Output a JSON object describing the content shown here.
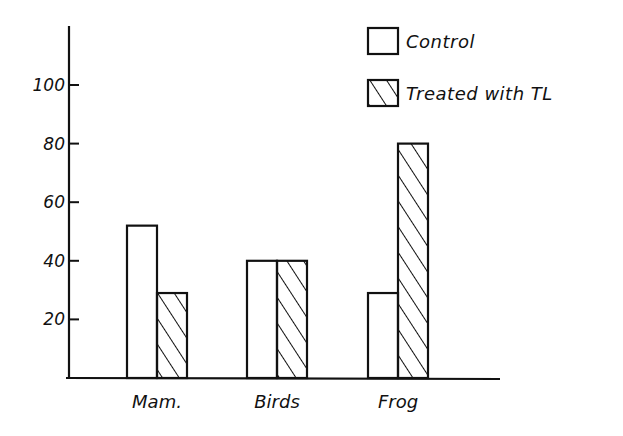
{
  "chart_data": {
    "type": "bar",
    "title": "",
    "xlabel": "",
    "ylabel": "",
    "categories": [
      "Mam.",
      "Birds",
      "Frog"
    ],
    "series": [
      {
        "name": "Control",
        "pattern": "none",
        "values": [
          52,
          40,
          29
        ]
      },
      {
        "name": "Treated with TL",
        "pattern": "diagonal-hatch",
        "values": [
          29,
          40,
          80
        ]
      }
    ],
    "yticks": [
      20,
      40,
      60,
      80,
      100
    ],
    "ylim": [
      0,
      120
    ],
    "grid": false,
    "legend_position": "top-right"
  },
  "colors": {
    "ink": "#111111",
    "background": "#ffffff"
  }
}
